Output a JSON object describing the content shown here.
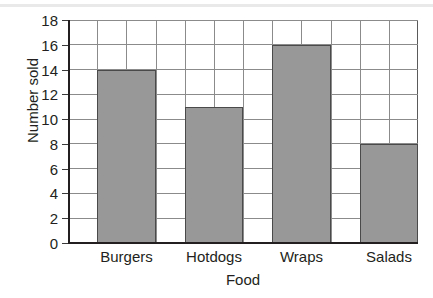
{
  "chart_data": {
    "type": "bar",
    "title": "",
    "xlabel": "Food",
    "ylabel": "Number sold",
    "categories": [
      "Burgers",
      "Hotdogs",
      "Wraps",
      "Salads"
    ],
    "values": [
      14,
      11,
      16,
      8
    ],
    "ylim": [
      0,
      18
    ],
    "ytick_step": 2,
    "yticks": [
      0,
      2,
      4,
      6,
      8,
      10,
      12,
      14,
      16,
      18
    ],
    "ytick_labels": [
      "0",
      "2",
      "4",
      "6",
      "8",
      "10",
      "12",
      "14",
      "16",
      "18"
    ],
    "grid": "both",
    "grid_columns": 12,
    "legend": "none",
    "bar_color": "#989898",
    "bar_edge_color": "#4a4a4a",
    "grid_color": "#8b8b8b",
    "axis_color": "#231f20",
    "background": "#ffffff"
  }
}
